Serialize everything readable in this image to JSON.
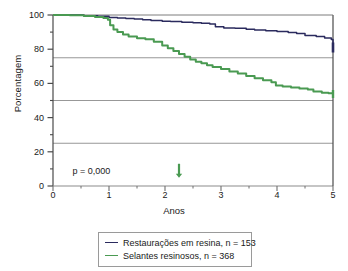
{
  "chart_data": {
    "type": "line",
    "title": "",
    "subtitle": "",
    "xlabel": "Anos",
    "ylabel": "Porcentagem",
    "xlim": [
      0,
      5
    ],
    "ylim": [
      0,
      100
    ],
    "xticks": [
      0,
      1,
      2,
      3,
      4,
      5
    ],
    "yticks": [
      0,
      20,
      40,
      60,
      80,
      100
    ],
    "yticks_minor": [
      10,
      30,
      50,
      70,
      90
    ],
    "gridlines_y": [
      25,
      50,
      75
    ],
    "grid": "horizontal-only",
    "legend_position": "below-plot",
    "annotations": [
      {
        "name": "p-value",
        "text": "p = 0,000",
        "x": 0.35,
        "y": 8
      },
      {
        "name": "median-arrow",
        "text": "↓",
        "x": 2.25,
        "y": 6,
        "color": "#4a9a52"
      }
    ],
    "series": [
      {
        "name": "Restaurações em resina, n = 153",
        "color": "#2b2b5e",
        "label": "Restaurações em resina",
        "n": 153,
        "points": [
          [
            0.0,
            100.0
          ],
          [
            0.35,
            100.0
          ],
          [
            0.55,
            99.6
          ],
          [
            0.8,
            99.2
          ],
          [
            1.0,
            98.6
          ],
          [
            1.15,
            98.3
          ],
          [
            1.3,
            98.0
          ],
          [
            1.45,
            97.6
          ],
          [
            1.6,
            97.2
          ],
          [
            1.75,
            96.8
          ],
          [
            1.95,
            96.4
          ],
          [
            2.1,
            96.2
          ],
          [
            2.3,
            95.8
          ],
          [
            2.5,
            95.4
          ],
          [
            2.65,
            95.2
          ],
          [
            2.8,
            94.8
          ],
          [
            2.9,
            93.2
          ],
          [
            3.05,
            92.4
          ],
          [
            3.25,
            92.2
          ],
          [
            3.45,
            91.6
          ],
          [
            3.6,
            91.2
          ],
          [
            3.8,
            90.8
          ],
          [
            4.0,
            90.4
          ],
          [
            4.2,
            89.8
          ],
          [
            4.35,
            89.2
          ],
          [
            4.5,
            88.0
          ],
          [
            4.7,
            87.4
          ],
          [
            4.85,
            86.6
          ],
          [
            4.97,
            85.6
          ],
          [
            5.0,
            81.0
          ]
        ]
      },
      {
        "name": "Selantes resinosos, n = 368",
        "color": "#4a9a52",
        "label": "Selantes resinosos",
        "n": 368,
        "points": [
          [
            0.0,
            100.0
          ],
          [
            0.3,
            99.8
          ],
          [
            0.55,
            99.4
          ],
          [
            0.75,
            98.8
          ],
          [
            0.9,
            98.2
          ],
          [
            0.98,
            97.2
          ],
          [
            1.02,
            94.0
          ],
          [
            1.08,
            91.5
          ],
          [
            1.15,
            90.0
          ],
          [
            1.25,
            88.6
          ],
          [
            1.35,
            87.4
          ],
          [
            1.5,
            86.4
          ],
          [
            1.65,
            85.8
          ],
          [
            1.8,
            84.4
          ],
          [
            1.95,
            82.2
          ],
          [
            2.05,
            80.6
          ],
          [
            2.15,
            79.0
          ],
          [
            2.25,
            77.2
          ],
          [
            2.35,
            75.6
          ],
          [
            2.45,
            74.0
          ],
          [
            2.55,
            72.6
          ],
          [
            2.65,
            71.8
          ],
          [
            2.75,
            70.6
          ],
          [
            2.85,
            69.6
          ],
          [
            3.0,
            68.4
          ],
          [
            3.15,
            67.0
          ],
          [
            3.3,
            65.8
          ],
          [
            3.45,
            64.4
          ],
          [
            3.6,
            63.0
          ],
          [
            3.75,
            61.8
          ],
          [
            3.9,
            60.6
          ],
          [
            3.98,
            58.8
          ],
          [
            4.1,
            58.2
          ],
          [
            4.25,
            57.6
          ],
          [
            4.4,
            57.0
          ],
          [
            4.55,
            56.4
          ],
          [
            4.65,
            55.2
          ],
          [
            4.8,
            54.6
          ],
          [
            4.92,
            54.2
          ],
          [
            5.0,
            53.8
          ]
        ]
      }
    ]
  }
}
